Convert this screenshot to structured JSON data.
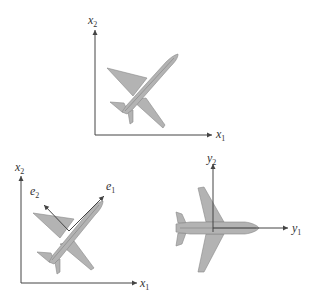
{
  "panels": {
    "top": {
      "axes": {
        "x_label": "x",
        "x_sub": "1",
        "y_label": "x",
        "y_sub": "2"
      },
      "airplane": {
        "orientation": "rotated ~40 degrees (nose up-right)"
      }
    },
    "bottom_left": {
      "axes": {
        "x_label": "x",
        "x_sub": "1",
        "y_label": "x",
        "y_sub": "2"
      },
      "vectors": [
        {
          "label": "e",
          "sub": "1",
          "direction": "along fuselage"
        },
        {
          "label": "e",
          "sub": "2",
          "direction": "perpendicular, up-left"
        }
      ],
      "airplane": {
        "orientation": "rotated ~40 degrees with body frame"
      }
    },
    "bottom_right": {
      "axes": {
        "x_label": "y",
        "x_sub": "1",
        "y_label": "y",
        "y_sub": "2"
      },
      "airplane": {
        "orientation": "aligned with y1 axis (horizontal)"
      }
    }
  },
  "colors": {
    "airplane_fill": "#b3b3b3",
    "airplane_stroke": "#888888",
    "axis": "#444444"
  }
}
